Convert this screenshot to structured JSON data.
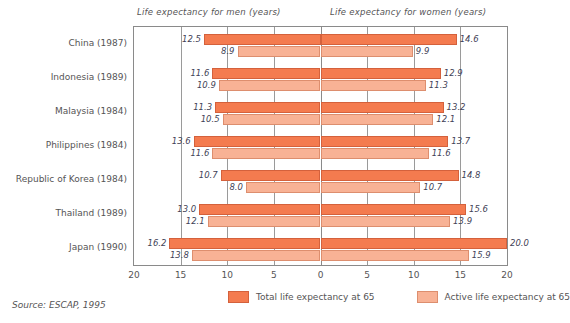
{
  "axis_titles": {
    "left": "Life expectancy for men (years)",
    "right": "Life expectancy for women (years)"
  },
  "source": "Source: ESCAP, 1995",
  "legend": {
    "total_label": "Total life expectancy at 65",
    "active_label": "Active life expectancy at 65",
    "total_color": "#f47b4f",
    "active_color": "#f8b295"
  },
  "chart_data": {
    "type": "bar",
    "title": "",
    "subtype": "diverging-butterfly",
    "xlabel": "",
    "ylabel": "",
    "xlim": [
      -20,
      20
    ],
    "xticks": [
      20,
      15,
      10,
      5,
      0,
      5,
      10,
      15,
      20
    ],
    "grid": true,
    "legend_position": "bottom",
    "left_axis_title": "Life expectancy for men (years)",
    "right_axis_title": "Life expectancy for women (years)",
    "categories": [
      "China (1987)",
      "Indonesia (1989)",
      "Malaysia (1984)",
      "Philippines (1984)",
      "Republic of Korea (1984)",
      "Thailand (1989)",
      "Japan (1990)"
    ],
    "series": [
      {
        "name": "Total life expectancy at 65",
        "side": "men",
        "values": [
          12.5,
          11.6,
          11.3,
          13.6,
          10.7,
          13.0,
          16.2
        ]
      },
      {
        "name": "Active life expectancy at 65",
        "side": "men",
        "values": [
          8.9,
          10.9,
          10.5,
          11.6,
          8.0,
          12.1,
          13.8
        ]
      },
      {
        "name": "Total life expectancy at 65",
        "side": "women",
        "values": [
          14.6,
          12.9,
          13.2,
          13.7,
          14.8,
          15.6,
          20.0
        ]
      },
      {
        "name": "Active life expectancy at 65",
        "side": "women",
        "values": [
          9.9,
          11.3,
          12.1,
          11.6,
          10.7,
          13.9,
          15.9
        ]
      }
    ]
  }
}
